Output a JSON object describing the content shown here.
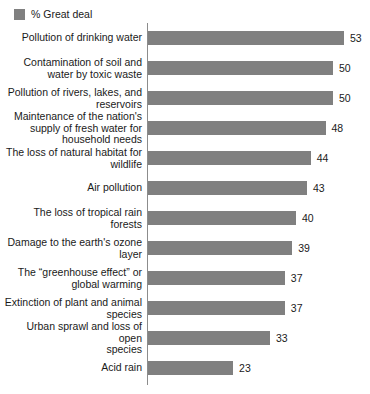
{
  "legend": {
    "icon": "legend-swatch-icon",
    "label": "% Great deal",
    "color": "#808080"
  },
  "style": {
    "bar_color": "#808080",
    "axis_color": "#8c8c8c",
    "text_color": "#1a1a1a",
    "background": "#ffffff"
  },
  "chart_data": {
    "type": "bar",
    "orientation": "horizontal",
    "title": "",
    "subtitle": "",
    "xlabel": "",
    "ylabel": "",
    "grid": false,
    "legend_position": "top-left",
    "xlim": [
      0,
      53
    ],
    "series": [
      {
        "name": "% Great deal",
        "color": "#808080",
        "values": [
          53,
          50,
          50,
          48,
          44,
          43,
          40,
          39,
          37,
          37,
          33,
          23
        ]
      }
    ],
    "categories": [
      "Pollution of drinking water",
      "Contamination of soil and\nwater by toxic waste",
      "Pollution of rivers, lakes, and\nreservoirs",
      "Maintenance of the nation's\nsupply of fresh water for\nhousehold needs",
      "The loss of natural habitat for\nwildlife",
      "Air pollution",
      "The loss of tropical rain forests",
      "Damage to the earth's ozone\nlayer",
      "The “greenhouse effect” or\nglobal warming",
      "Extinction of plant and animal\nspecies",
      "Urban sprawl and loss of open\nspecies",
      "Acid rain"
    ],
    "value_labels": [
      "53",
      "50",
      "50",
      "48",
      "44",
      "43",
      "40",
      "39",
      "37",
      "37",
      "33",
      "23"
    ]
  }
}
